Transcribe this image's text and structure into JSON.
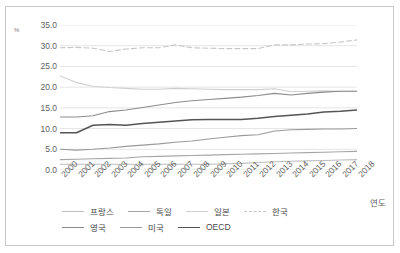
{
  "chart_data": {
    "type": "line",
    "title": "",
    "xlabel": "연도",
    "ylabel": "%",
    "unit_symbol": "%",
    "grid": true,
    "legend_position": "bottom",
    "ylim": [
      0,
      35
    ],
    "ytick_step": 5,
    "yticks": [
      "0.0",
      "5.0",
      "10.0",
      "15.0",
      "20.0",
      "25.0",
      "30.0",
      "35.0"
    ],
    "categories": [
      "2000",
      "2001",
      "2002",
      "2003",
      "2004",
      "2005",
      "2006",
      "2007",
      "2008",
      "2009",
      "2010",
      "2011",
      "2012",
      "2013",
      "2014",
      "2015",
      "2016",
      "2017",
      "2018"
    ],
    "series": [
      {
        "name": "프랑스",
        "color": "#bdbdbd",
        "dash": "solid",
        "values": [
          1.4,
          1.4,
          1.4,
          1.4,
          1.4,
          1.4,
          1.4,
          1.4,
          1.4,
          1.4,
          1.5,
          1.6,
          1.8,
          2.0,
          2.1,
          2.2,
          2.3,
          2.4,
          2.5
        ]
      },
      {
        "name": "독일",
        "color": "#a6a6a6",
        "dash": "solid",
        "values": [
          2.5,
          2.6,
          2.7,
          2.8,
          2.9,
          3.2,
          3.3,
          3.4,
          3.5,
          3.6,
          3.7,
          3.8,
          3.9,
          4.0,
          4.1,
          4.2,
          4.3,
          4.4,
          4.5
        ]
      },
      {
        "name": "일본",
        "color": "#cfcfcf",
        "dash": "solid",
        "values": [
          22.7,
          21.1,
          20.2,
          19.9,
          19.7,
          19.5,
          19.5,
          19.7,
          19.6,
          19.5,
          19.4,
          19.4,
          19.4,
          19.6,
          18.9,
          19.0,
          19.1,
          19.0,
          19.0
        ]
      },
      {
        "name": "한국",
        "color": "#c6c6c6",
        "dash": "dashed",
        "values": [
          29.5,
          29.6,
          29.4,
          28.6,
          29.2,
          29.5,
          29.5,
          30.2,
          29.5,
          29.4,
          29.3,
          29.3,
          29.3,
          30.2,
          30.2,
          30.4,
          30.5,
          30.9,
          31.4
        ]
      },
      {
        "name": "영국",
        "color": "#8c8c8c",
        "dash": "solid",
        "values": [
          12.8,
          12.8,
          13.1,
          14.1,
          14.5,
          15.1,
          15.7,
          16.3,
          16.7,
          17.0,
          17.3,
          17.6,
          18.0,
          18.5,
          18.1,
          18.5,
          18.8,
          19.0,
          19.0
        ]
      },
      {
        "name": "미국",
        "color": "#9a9a9a",
        "dash": "solid",
        "values": [
          5.0,
          4.8,
          5.0,
          5.3,
          5.7,
          6.0,
          6.3,
          6.7,
          7.0,
          7.5,
          7.9,
          8.3,
          8.5,
          9.4,
          9.7,
          9.8,
          9.9,
          9.9,
          10.0
        ]
      },
      {
        "name": "OECD",
        "color": "#555555",
        "dash": "solid",
        "values": [
          9.0,
          9.0,
          10.8,
          11.0,
          10.8,
          11.2,
          11.5,
          11.8,
          12.1,
          12.2,
          12.2,
          12.2,
          12.5,
          12.9,
          13.2,
          13.5,
          14.0,
          14.2,
          14.5
        ]
      }
    ],
    "japan_uk_note": ""
  }
}
